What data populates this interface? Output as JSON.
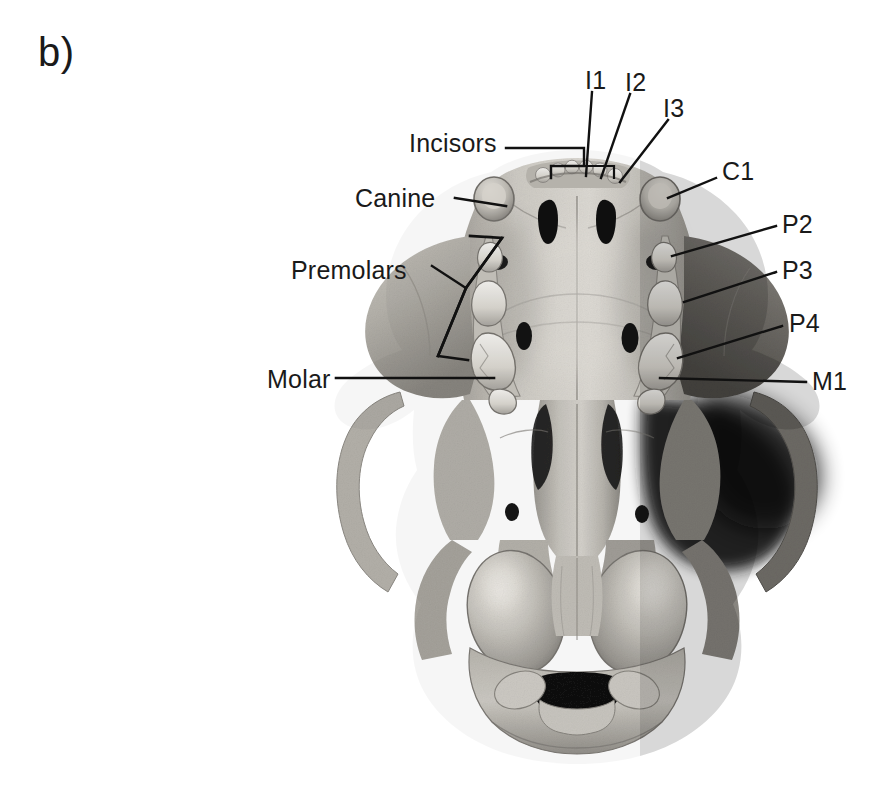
{
  "figure": {
    "panel_letter": "b)",
    "background_color": "#ffffff",
    "text_color": "#1a1a1a",
    "leader_color": "#111111",
    "specimen": "ventral-skull-photograph",
    "view": "ventral (palatal) view of mammalian skull",
    "palette": {
      "bone_light": "#e9e7e3",
      "bone_mid": "#b9b5ae",
      "bone_shadow": "#8d8a84",
      "bone_dark": "#5d5b57",
      "cavity_black": "#141414",
      "tooth_white": "#f2f1ee"
    }
  },
  "labels": {
    "group_labels": [
      {
        "id": "incisors",
        "text": "Incisors",
        "x": 409,
        "y": 131
      },
      {
        "id": "canine",
        "text": "Canine",
        "x": 355,
        "y": 186
      },
      {
        "id": "premolars",
        "text": "Premolars",
        "x": 291,
        "y": 258
      },
      {
        "id": "molar",
        "text": "Molar",
        "x": 267,
        "y": 367
      }
    ],
    "tooth_labels": [
      {
        "id": "i1",
        "text": "I1",
        "x": 585,
        "y": 68
      },
      {
        "id": "i2",
        "text": "I2",
        "x": 625,
        "y": 70
      },
      {
        "id": "i3",
        "text": "I3",
        "x": 663,
        "y": 96
      },
      {
        "id": "c1",
        "text": "C1",
        "x": 722,
        "y": 159
      },
      {
        "id": "p2",
        "text": "P2",
        "x": 782,
        "y": 212
      },
      {
        "id": "p3",
        "text": "P3",
        "x": 782,
        "y": 258
      },
      {
        "id": "p4",
        "text": "P4",
        "x": 789,
        "y": 311
      },
      {
        "id": "m1",
        "text": "M1",
        "x": 812,
        "y": 369
      }
    ]
  },
  "leaders": {
    "incisors_bracket": "horizontal rule from text to a squared bracket over the incisor row",
    "canine_line": "straight diagonal to left canine crown",
    "premolars_bracket": "slanted rectangular bracket spanning left premolar row",
    "molar_line": "long horizontal rule to left molar",
    "tooth_leaders": "thin straight lines from each tooth abbreviation to its crown"
  }
}
